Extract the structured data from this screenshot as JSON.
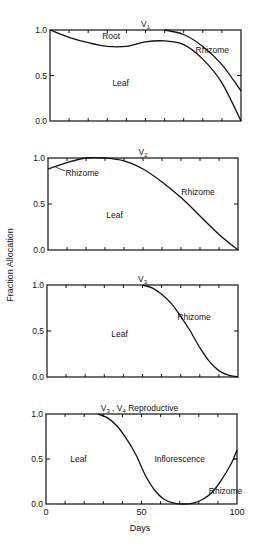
{
  "figure": {
    "ylabel": "Fraction  Allocation",
    "xlabel": "Days",
    "x_ticks": [
      "0",
      "50",
      "100"
    ]
  },
  "chart_data": [
    {
      "type": "area",
      "title": "V1",
      "title_main": "V",
      "title_sub": "1",
      "xlabel": "Days",
      "ylabel": "Fraction Allocation",
      "xlim": [
        0,
        100
      ],
      "ylim": [
        0,
        1
      ],
      "y_ticks": [
        "1.0",
        "0.5",
        "0.0"
      ],
      "boundaries": [
        {
          "name": "leaf_root",
          "x": [
            0,
            10,
            20,
            30,
            40,
            50,
            60,
            70,
            80,
            90,
            100
          ],
          "y": [
            1.0,
            0.92,
            0.86,
            0.82,
            0.82,
            0.87,
            0.88,
            0.84,
            0.68,
            0.42,
            0.0
          ]
        },
        {
          "name": "root_rhizome",
          "x": [
            60,
            70,
            80,
            90,
            100
          ],
          "y": [
            1.0,
            0.95,
            0.82,
            0.62,
            0.33
          ]
        }
      ],
      "regions": [
        {
          "label": "Root",
          "x": 32,
          "y": 0.93
        },
        {
          "label": "Leaf",
          "x": 37,
          "y": 0.42
        },
        {
          "label": "Rhizome",
          "x": 85,
          "y": 0.78
        }
      ]
    },
    {
      "type": "area",
      "title": "V2",
      "title_main": "V",
      "title_sub": "2",
      "xlabel": "Days",
      "ylabel": "Fraction Allocation",
      "xlim": [
        0,
        100
      ],
      "ylim": [
        0,
        1
      ],
      "y_ticks": [
        "1.0",
        "0.5",
        "0.0"
      ],
      "boundaries": [
        {
          "name": "leaf_rhizome",
          "x": [
            0,
            10,
            20,
            30,
            40,
            50,
            60,
            70,
            80,
            90,
            100
          ],
          "y": [
            0.88,
            0.95,
            1.0,
            1.0,
            0.97,
            0.88,
            0.74,
            0.57,
            0.37,
            0.17,
            0.0
          ]
        }
      ],
      "regions": [
        {
          "label": "Rhizome",
          "x": 18,
          "y": 0.84
        },
        {
          "label": "Leaf",
          "x": 35,
          "y": 0.38
        },
        {
          "label": "Rhizome",
          "x": 79,
          "y": 0.63
        }
      ]
    },
    {
      "type": "area",
      "title": "V3",
      "title_main": "V",
      "title_sub": "3",
      "xlabel": "Days",
      "ylabel": "Fraction Allocation",
      "xlim": [
        0,
        100
      ],
      "ylim": [
        0,
        1
      ],
      "y_ticks": [
        "1.0",
        "0.5",
        "0.0"
      ],
      "boundaries": [
        {
          "name": "leaf_rhizome",
          "x": [
            50,
            55,
            60,
            65,
            70,
            75,
            80,
            85,
            90,
            95,
            100
          ],
          "y": [
            1.0,
            0.97,
            0.9,
            0.8,
            0.66,
            0.5,
            0.32,
            0.17,
            0.07,
            0.02,
            0.0
          ]
        }
      ],
      "regions": [
        {
          "label": "Leaf",
          "x": 38,
          "y": 0.47
        },
        {
          "label": "Rhizome",
          "x": 77,
          "y": 0.65
        }
      ]
    },
    {
      "type": "area",
      "title": "V3, V4 Reproductive",
      "title_main": "V",
      "title_sub": "3",
      "title_main2": "V",
      "title_sub2": "4",
      "title_suffix": "Reproductive",
      "xlabel": "Days",
      "ylabel": "Fraction Allocation",
      "xlim": [
        0,
        100
      ],
      "ylim": [
        0,
        1
      ],
      "x_ticks": [
        0,
        50,
        100
      ],
      "y_ticks": [
        "1.0",
        "0.5",
        "0.0"
      ],
      "boundaries": [
        {
          "name": "leaf_inflorescence_rhizome",
          "x": [
            27,
            32,
            37,
            42,
            47,
            52,
            57,
            62,
            67,
            72,
            77,
            82,
            87,
            92,
            97,
            100
          ],
          "y": [
            1.0,
            0.96,
            0.87,
            0.73,
            0.55,
            0.32,
            0.15,
            0.05,
            0.01,
            0.0,
            0.01,
            0.05,
            0.13,
            0.27,
            0.45,
            0.6
          ]
        }
      ],
      "regions": [
        {
          "label": "Leaf",
          "x": 17,
          "y": 0.5
        },
        {
          "label": "Inflorescence",
          "x": 70,
          "y": 0.5
        },
        {
          "label": "Rhizome",
          "x": 94,
          "y": 0.14
        }
      ]
    }
  ]
}
